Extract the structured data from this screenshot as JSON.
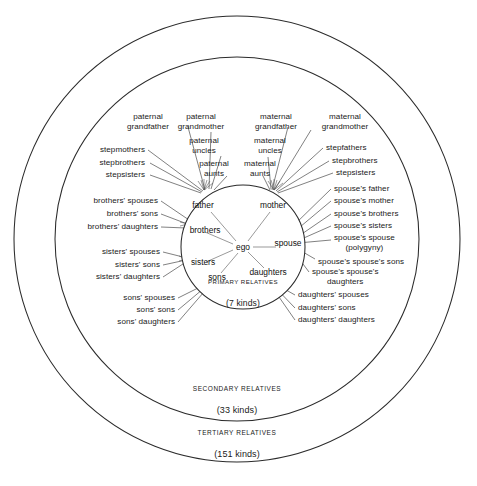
{
  "figure": {
    "background_color": "#ffffff",
    "line_color": "#2b2b2b"
  },
  "rings": [
    {
      "name": "primary",
      "title": "PRIMARY RELATIVES",
      "subtitle": "(7 kinds)",
      "count": 7
    },
    {
      "name": "secondary",
      "title": "SECONDARY RELATIVES",
      "subtitle": "(33 kinds)",
      "count": 33
    },
    {
      "name": "tertiary",
      "title": "TERTIARY RELATIVES",
      "subtitle": "(151 kinds)",
      "count": 151
    }
  ],
  "center": {
    "label": "ego"
  },
  "primary_relatives": [
    {
      "label": "father",
      "x": 203,
      "y": 205
    },
    {
      "label": "mother",
      "x": 273,
      "y": 205
    },
    {
      "label": "brothers",
      "x": 195,
      "y": 230
    },
    {
      "label": "spouse",
      "x": 286,
      "y": 243
    },
    {
      "label": "sisters",
      "x": 198,
      "y": 262
    },
    {
      "label": "sons",
      "x": 215,
      "y": 278
    },
    {
      "label": "daughters",
      "x": 267,
      "y": 273
    }
  ],
  "secondary_relatives": [
    {
      "label": "paternal\ngrandfather",
      "anchor": "c",
      "x": 148,
      "y": 122
    },
    {
      "label": "paternal\ngrandmother",
      "anchor": "c",
      "x": 199,
      "y": 122
    },
    {
      "label": "maternal\ngrandfather",
      "anchor": "c",
      "x": 267,
      "y": 122
    },
    {
      "label": "maternal\ngrandmother",
      "anchor": "c",
      "x": 343,
      "y": 122
    },
    {
      "label": "paternal\nuncles",
      "anchor": "c",
      "x": 203,
      "y": 146
    },
    {
      "label": "maternal\nuncles",
      "anchor": "c",
      "x": 264,
      "y": 146
    },
    {
      "label": "paternal\naunts",
      "anchor": "c",
      "x": 212,
      "y": 168
    },
    {
      "label": "maternal\naunts",
      "anchor": "c",
      "x": 257,
      "y": 168
    },
    {
      "label": "stepmothers",
      "anchor": "r",
      "x": 145,
      "y": 150
    },
    {
      "label": "stepbrothers",
      "anchor": "r",
      "x": 145,
      "y": 163
    },
    {
      "label": "stepsisters",
      "anchor": "r",
      "x": 145,
      "y": 175
    },
    {
      "label": "stepfathers",
      "anchor": "l",
      "x": 326,
      "y": 148
    },
    {
      "label": "stepbrothers",
      "anchor": "l",
      "x": 332,
      "y": 161
    },
    {
      "label": "stepsisters",
      "anchor": "l",
      "x": 336,
      "y": 173
    },
    {
      "label": "brothers' spouses",
      "anchor": "r",
      "x": 158,
      "y": 201
    },
    {
      "label": "brothers' sons",
      "anchor": "r",
      "x": 158,
      "y": 214
    },
    {
      "label": "brothers' daughters",
      "anchor": "r",
      "x": 158,
      "y": 227
    },
    {
      "label": "sisters' spouses",
      "anchor": "r",
      "x": 160,
      "y": 252
    },
    {
      "label": "sisters' sons",
      "anchor": "r",
      "x": 160,
      "y": 265
    },
    {
      "label": "sisters' daughters",
      "anchor": "r",
      "x": 160,
      "y": 277
    },
    {
      "label": "sons' spouses",
      "anchor": "r",
      "x": 175,
      "y": 298
    },
    {
      "label": "sons' sons",
      "anchor": "r",
      "x": 175,
      "y": 310
    },
    {
      "label": "sons' daughters",
      "anchor": "r",
      "x": 175,
      "y": 322
    },
    {
      "label": "spouse's father",
      "anchor": "l",
      "x": 334,
      "y": 189
    },
    {
      "label": "spouse's mother",
      "anchor": "l",
      "x": 334,
      "y": 201
    },
    {
      "label": "spouse's brothers",
      "anchor": "l",
      "x": 334,
      "y": 214
    },
    {
      "label": "spouse's sisters",
      "anchor": "l",
      "x": 334,
      "y": 226
    },
    {
      "label": "spouse's spouse\n(polygyny)",
      "anchor": "l",
      "x": 334,
      "y": 243
    },
    {
      "label": "spouse's spouse's sons",
      "anchor": "l",
      "x": 318,
      "y": 262
    },
    {
      "label": "spouse's spouse's\ndaughters",
      "anchor": "l",
      "x": 312,
      "y": 277
    },
    {
      "label": "daughters' spouses",
      "anchor": "l",
      "x": 298,
      "y": 295
    },
    {
      "label": "daughters' sons",
      "anchor": "l",
      "x": 298,
      "y": 308
    },
    {
      "label": "daughters' daughters",
      "anchor": "l",
      "x": 298,
      "y": 320
    }
  ],
  "geometry": {
    "center_x": 237,
    "center_y": 239,
    "inner_radius": 62,
    "middle_radius": 182,
    "outer_radius": 224,
    "inner_center_y": 247
  }
}
